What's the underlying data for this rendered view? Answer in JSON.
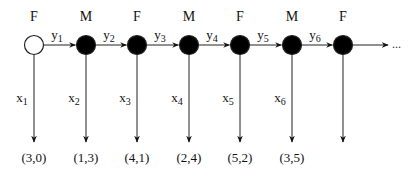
{
  "diagram": {
    "type": "chain",
    "colors": {
      "stroke": "#222222",
      "filled_node": "#000000",
      "open_node": "#ffffff"
    },
    "nodes": [
      {
        "sex": "F",
        "filled": false,
        "x_label": "x",
        "x_sub": "1",
        "coord": "(3,0)"
      },
      {
        "sex": "M",
        "filled": true,
        "x_label": "x",
        "x_sub": "2",
        "coord": "(1,3)"
      },
      {
        "sex": "F",
        "filled": true,
        "x_label": "x",
        "x_sub": "3",
        "coord": "(4,1)"
      },
      {
        "sex": "M",
        "filled": true,
        "x_label": "x",
        "x_sub": "4",
        "coord": "(2,4)"
      },
      {
        "sex": "F",
        "filled": true,
        "x_label": "x",
        "x_sub": "5",
        "coord": "(5,2)"
      },
      {
        "sex": "M",
        "filled": true,
        "x_label": "x",
        "x_sub": "6",
        "coord": "(3,5)"
      },
      {
        "sex": "F",
        "filled": true,
        "x_label": "",
        "x_sub": "",
        "coord": ""
      }
    ],
    "edges": [
      {
        "label": "y",
        "sub": "1"
      },
      {
        "label": "y",
        "sub": "2"
      },
      {
        "label": "y",
        "sub": "3"
      },
      {
        "label": "y",
        "sub": "4"
      },
      {
        "label": "y",
        "sub": "5"
      },
      {
        "label": "y",
        "sub": "6"
      }
    ],
    "continuation": "..."
  }
}
